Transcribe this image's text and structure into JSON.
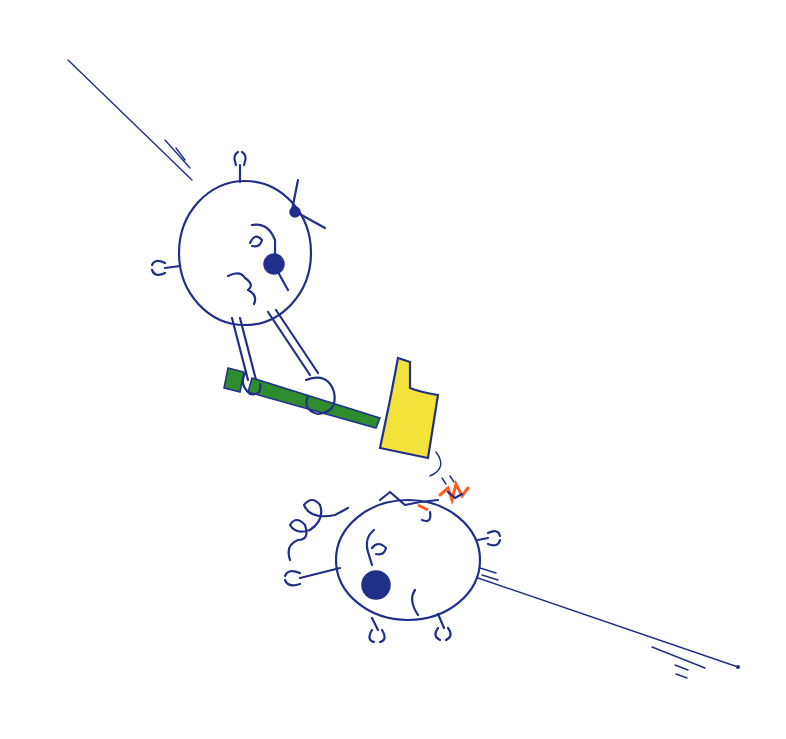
{
  "scene": {
    "description": "Hand-drawn doodle of two round creatures on a diagonal line; the upper creature swings a green-handled yellow hammer down onto the head of the lower creature.",
    "characters": [
      {
        "name": "attacker",
        "position": "upper-left",
        "holding": "hammer"
      },
      {
        "name": "victim",
        "position": "lower-right",
        "state": "struck on head"
      }
    ],
    "objects": [
      {
        "name": "hammer",
        "handle_color": "green",
        "head_color": "yellow"
      },
      {
        "name": "diagonal-line",
        "from": [
          68,
          60
        ],
        "to": [
          738,
          667
        ]
      }
    ]
  },
  "colors": {
    "ink": "#1f2f8a",
    "hammer_handle": "#2e8b2e",
    "hammer_head": "#f2e23a",
    "impact_orange": "#ff5a1f",
    "background": "#ffffff"
  }
}
